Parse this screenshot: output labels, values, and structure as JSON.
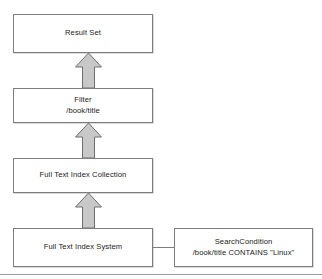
{
  "diagram": {
    "type": "flowchart",
    "direction": "bottom-to-top",
    "nodes": {
      "result_set": {
        "label": "Result Set",
        "lines": [
          "Result Set"
        ]
      },
      "filter": {
        "lines": [
          "Filter",
          "/book/title"
        ],
        "line1": "Filter",
        "line2": "/book/title"
      },
      "index_collection": {
        "label": "Full Text Index Collection",
        "lines": [
          "Full Text Index Collection"
        ]
      },
      "index_system": {
        "label": "Full Text Index System",
        "lines": [
          "Full Text Index System"
        ]
      },
      "search_condition": {
        "lines": [
          "SearchCondition",
          "/book/title CONTAINS \"Linux\""
        ],
        "line1": "SearchCondition",
        "line2": "/book/title CONTAINS \"Linux\""
      }
    },
    "arrows": [
      {
        "name": "arrow-index-system-to-collection",
        "from": "index_system",
        "to": "index_collection",
        "direction": "up",
        "style": "block-arrow"
      },
      {
        "name": "arrow-collection-to-filter",
        "from": "index_collection",
        "to": "filter",
        "direction": "up",
        "style": "block-arrow"
      },
      {
        "name": "arrow-filter-to-result-set",
        "from": "filter",
        "to": "result_set",
        "direction": "up",
        "style": "block-arrow"
      }
    ],
    "connectors": [
      {
        "name": "connector-index-system-to-search-condition",
        "from": "index_system",
        "to": "search_condition",
        "style": "plain-line"
      }
    ],
    "colors": {
      "box_border": "#7d7d7d",
      "box_fill": "#ffffff",
      "arrow_fill": "#c8c8c8",
      "arrow_border": "#6f6f6f",
      "text": "#1a1a1a",
      "rule": "#9a9a9a"
    }
  }
}
